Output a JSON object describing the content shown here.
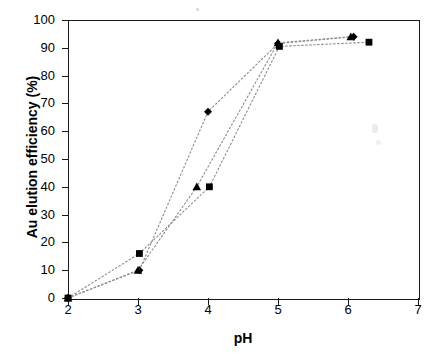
{
  "chart_data": {
    "type": "scatter",
    "title": "",
    "subtitle": "",
    "xlabel": "pH",
    "ylabel": "Au elution efficiency (%)",
    "xlim": [
      2,
      7
    ],
    "ylim": [
      0,
      100
    ],
    "x_ticks": [
      2,
      3,
      4,
      5,
      6,
      7
    ],
    "y_ticks": [
      0,
      10,
      20,
      30,
      40,
      50,
      60,
      70,
      80,
      90,
      100
    ],
    "grid": false,
    "legend": "none",
    "line_style": "dotted",
    "line_color": "#8c8c8c",
    "marker_color": "#000000",
    "series": [
      {
        "name": "series-diamond",
        "marker": "diamond",
        "points": [
          {
            "x": 2.0,
            "y": 0
          },
          {
            "x": 3.02,
            "y": 10
          },
          {
            "x": 4.0,
            "y": 67
          },
          {
            "x": 5.0,
            "y": 91.5
          },
          {
            "x": 6.08,
            "y": 94
          }
        ]
      },
      {
        "name": "series-triangle",
        "marker": "triangle",
        "points": [
          {
            "x": 2.0,
            "y": 0
          },
          {
            "x": 3.0,
            "y": 10
          },
          {
            "x": 3.84,
            "y": 40
          },
          {
            "x": 5.0,
            "y": 91.8
          },
          {
            "x": 6.04,
            "y": 94
          }
        ]
      },
      {
        "name": "series-square",
        "marker": "square",
        "points": [
          {
            "x": 2.0,
            "y": 0
          },
          {
            "x": 3.02,
            "y": 16
          },
          {
            "x": 4.02,
            "y": 40
          },
          {
            "x": 5.02,
            "y": 90.5
          },
          {
            "x": 6.3,
            "y": 92
          }
        ]
      }
    ]
  },
  "axes": {
    "x_tick_labels": [
      "2",
      "3",
      "4",
      "5",
      "6",
      "7"
    ],
    "y_tick_labels": [
      "0",
      "10",
      "20",
      "30",
      "40",
      "50",
      "60",
      "70",
      "80",
      "90",
      "100"
    ],
    "x_title": "pH",
    "y_title": "Au elution efficiency (%)"
  }
}
